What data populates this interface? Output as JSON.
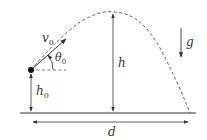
{
  "diagram": {
    "labels": {
      "velocity": "v",
      "velocity_sub": "0",
      "angle": "θ",
      "angle_sub": "0",
      "initial_height": "h",
      "initial_height_sub": "0",
      "max_height": "h",
      "gravity": "g",
      "distance": "d"
    },
    "colors": {
      "stroke": "#333333",
      "trajectory": "#555555"
    }
  }
}
